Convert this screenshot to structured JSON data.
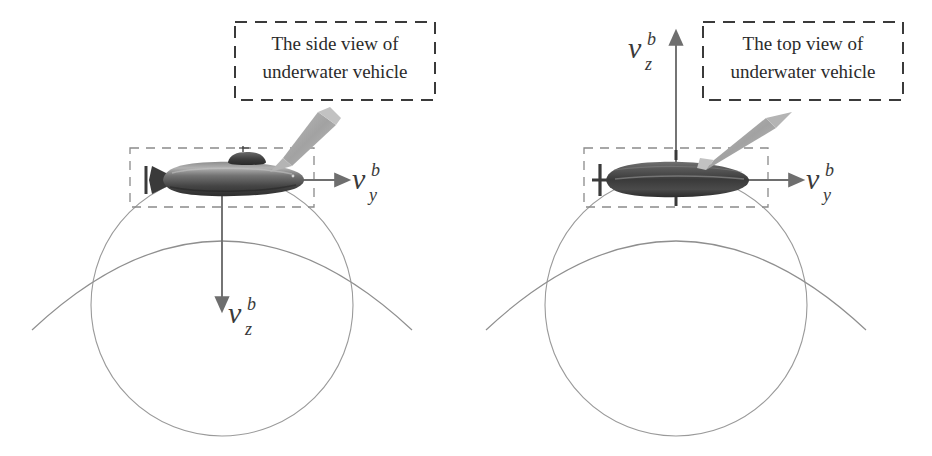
{
  "figure": {
    "background_color": "#ffffff",
    "width": 932,
    "height": 456
  },
  "colors": {
    "callout_border": "#3a3a3a",
    "callout_text": "#2b2b2b",
    "vehicle_box_dash": "#8a8a8a",
    "axis_arrow": "#6e6e6e",
    "vector_label": "#3a3a3a",
    "circle_stroke": "#9a9a9a",
    "arc_stroke": "#8f8f8f",
    "pointer_gray": "#a8a8a8",
    "hull_dark": "#3c3c3c",
    "hull_mid": "#6b6b6b",
    "hull_light": "#9e9e9e"
  },
  "panels": [
    {
      "id": "side-view",
      "callout": {
        "line1": "The side view of",
        "line2": "underwater vehicle"
      },
      "pointer": {
        "name": "callout-pointer-arrow",
        "direction": "down-left"
      },
      "vehicle": {
        "name": "underwater-vehicle-side",
        "orientation": "side",
        "has_conning_tower": true,
        "has_mast": true
      },
      "vectors": [
        {
          "name": "velocity-vector-vy",
          "symbol": "v",
          "subscript": "y",
          "superscript": "b",
          "direction": "right"
        },
        {
          "name": "velocity-vector-vz",
          "symbol": "v",
          "subscript": "z",
          "superscript": "b",
          "direction": "down"
        }
      ],
      "beam_circle": {
        "name": "sonar-footprint-circle"
      },
      "beam_arc": {
        "name": "sonar-beam-arc"
      },
      "bounding_box": {
        "name": "vehicle-bounding-box",
        "style": "dashed"
      }
    },
    {
      "id": "top-view",
      "callout": {
        "line1": "The top view of",
        "line2": "underwater vehicle"
      },
      "pointer": {
        "name": "callout-pointer-arrow",
        "direction": "up-right"
      },
      "vehicle": {
        "name": "underwater-vehicle-top",
        "orientation": "top",
        "has_conning_tower": false,
        "has_fins": true
      },
      "vectors": [
        {
          "name": "velocity-vector-vy",
          "symbol": "v",
          "subscript": "y",
          "superscript": "b",
          "direction": "right"
        },
        {
          "name": "velocity-vector-vz",
          "symbol": "v",
          "subscript": "z",
          "superscript": "b",
          "direction": "up"
        }
      ],
      "beam_circle": {
        "name": "sonar-footprint-circle"
      },
      "beam_arc": {
        "name": "sonar-beam-arc"
      },
      "bounding_box": {
        "name": "vehicle-bounding-box",
        "style": "dashed"
      }
    }
  ]
}
